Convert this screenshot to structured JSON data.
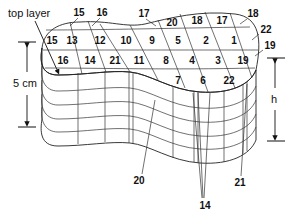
{
  "labels": {
    "top_layer": "top layer",
    "left_dimension": "5 cm",
    "right_dimension": "h"
  },
  "colors": {
    "top_surface": "#d4d4d4",
    "side": "#ffffff",
    "lines": "#222222"
  },
  "top_grid": {
    "row1": [
      "15",
      "13",
      "12",
      "10",
      "9",
      "5",
      "2",
      "1"
    ],
    "row2": [
      "16",
      "14",
      "21",
      "11",
      "8",
      "4",
      "3",
      "19"
    ],
    "row3": [
      "7",
      "6",
      "22"
    ],
    "top_edge": [
      "20",
      "18",
      "17"
    ]
  },
  "callouts": {
    "top_15": "15",
    "top_16": "16",
    "top_17": "17",
    "right_18": "18",
    "right_22": "22",
    "right_19": "19",
    "bottom_20": "20",
    "bottom_14": "14",
    "bottom_21": "21"
  }
}
